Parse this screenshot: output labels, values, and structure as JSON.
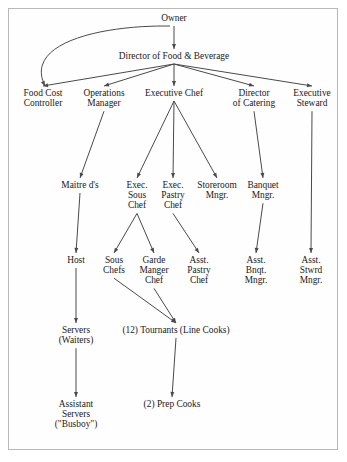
{
  "figure": {
    "kind": "organization-chart",
    "title_visible": false,
    "border_color": "#b9b9b5",
    "background_color": "#ffffff",
    "text_color": "#1a1a1a",
    "edge_color": "#4a4a4a"
  },
  "chart_data": {
    "type": "diagram",
    "subtype": "hierarchical-org-chart",
    "title": "",
    "orientation": "top-down",
    "nodes": [
      {
        "id": "owner",
        "label": "Owner",
        "lines": [
          "Owner"
        ],
        "level": 1,
        "x": 174,
        "y": 21
      },
      {
        "id": "dir_fb",
        "label": "Director of Food & Beverage",
        "lines": [
          "Director of Food & Beverage"
        ],
        "level": 2,
        "x": 174,
        "y": 59
      },
      {
        "id": "food_cost",
        "label": "Food Cost Controller",
        "lines": [
          "Food Cost",
          "Controller"
        ],
        "level": 3,
        "x": 43,
        "y": 96
      },
      {
        "id": "ops_mgr",
        "label": "Operations Manager",
        "lines": [
          "Operations",
          "Manager"
        ],
        "level": 3,
        "x": 104,
        "y": 96
      },
      {
        "id": "exec_chef",
        "label": "Executive Chef",
        "lines": [
          "Executive Chef"
        ],
        "level": 3,
        "x": 174,
        "y": 96
      },
      {
        "id": "dir_catering",
        "label": "Director of Catering",
        "lines": [
          "Director",
          "of Catering"
        ],
        "level": 3,
        "x": 254,
        "y": 96
      },
      {
        "id": "exec_steward",
        "label": "Executive Steward",
        "lines": [
          "Executive",
          "Steward"
        ],
        "level": 3,
        "x": 312,
        "y": 96
      },
      {
        "id": "maitre_d",
        "label": "Maitre d's",
        "lines": [
          "Maitre d's"
        ],
        "level": 4,
        "x": 80,
        "y": 188
      },
      {
        "id": "exec_sous",
        "label": "Exec. Sous Chef",
        "lines": [
          "Exec.",
          "Sous",
          "Chef"
        ],
        "level": 4,
        "x": 137,
        "y": 188
      },
      {
        "id": "exec_pastry",
        "label": "Exec. Pastry Chef",
        "lines": [
          "Exec.",
          "Pastry",
          "Chef"
        ],
        "level": 4,
        "x": 173,
        "y": 188
      },
      {
        "id": "storeroom",
        "label": "Storeroom Mngr.",
        "lines": [
          "Storeroom",
          "Mngr."
        ],
        "level": 4,
        "x": 217,
        "y": 188
      },
      {
        "id": "banquet",
        "label": "Banquet Mngr.",
        "lines": [
          "Banquet",
          "Mngr."
        ],
        "level": 4,
        "x": 263,
        "y": 188
      },
      {
        "id": "host",
        "label": "Host",
        "lines": [
          "Host"
        ],
        "level": 5,
        "x": 76,
        "y": 263
      },
      {
        "id": "sous_chefs",
        "label": "Sous Chefs",
        "lines": [
          "Sous",
          "Chefs"
        ],
        "level": 5,
        "x": 114,
        "y": 263
      },
      {
        "id": "garde_manger",
        "label": "Garde Manger Chef",
        "lines": [
          "Garde",
          "Manger",
          "Chef"
        ],
        "level": 5,
        "x": 154,
        "y": 263
      },
      {
        "id": "asst_pastry",
        "label": "Asst. Pastry Chef",
        "lines": [
          "Asst.",
          "Pastry",
          "Chef"
        ],
        "level": 5,
        "x": 199,
        "y": 263
      },
      {
        "id": "asst_bnqt",
        "label": "Asst. Bnqt. Mngr.",
        "lines": [
          "Asst.",
          "Bnqt.",
          "Mngr."
        ],
        "level": 5,
        "x": 256,
        "y": 263
      },
      {
        "id": "asst_stwrd",
        "label": "Asst. Stwrd Mngr.",
        "lines": [
          "Asst.",
          "Stwrd",
          "Mngr."
        ],
        "level": 5,
        "x": 311,
        "y": 263
      },
      {
        "id": "servers",
        "label": "Servers (Waiters)",
        "lines": [
          "Servers",
          "(Waiters)"
        ],
        "level": 6,
        "x": 76,
        "y": 333
      },
      {
        "id": "tournants",
        "label": "(12) Tournants (Line Cooks)",
        "lines": [
          "(12) Tournants (Line Cooks)"
        ],
        "level": 6,
        "x": 176,
        "y": 333
      },
      {
        "id": "asst_servers",
        "label": "Assistant Servers (\"Busboy\")",
        "lines": [
          "Assistant",
          "Servers",
          "(\"Busboy\")"
        ],
        "level": 7,
        "x": 76,
        "y": 407
      },
      {
        "id": "prep_cooks",
        "label": "(2) Prep Cooks",
        "lines": [
          "(2) Prep Cooks"
        ],
        "level": 7,
        "x": 172,
        "y": 407
      }
    ],
    "edges": [
      {
        "from": "owner",
        "to": "dir_fb",
        "style": "straight-arrow"
      },
      {
        "from": "owner",
        "to": "food_cost",
        "style": "curved-arrow"
      },
      {
        "from": "dir_fb",
        "to": "food_cost",
        "style": "straight-arrow"
      },
      {
        "from": "dir_fb",
        "to": "ops_mgr",
        "style": "straight-arrow"
      },
      {
        "from": "dir_fb",
        "to": "exec_chef",
        "style": "straight-arrow"
      },
      {
        "from": "dir_fb",
        "to": "dir_catering",
        "style": "straight-arrow"
      },
      {
        "from": "dir_fb",
        "to": "exec_steward",
        "style": "straight-arrow"
      },
      {
        "from": "ops_mgr",
        "to": "maitre_d",
        "style": "straight-arrow"
      },
      {
        "from": "exec_chef",
        "to": "exec_sous",
        "style": "straight-arrow"
      },
      {
        "from": "exec_chef",
        "to": "exec_pastry",
        "style": "straight-arrow"
      },
      {
        "from": "exec_chef",
        "to": "storeroom",
        "style": "straight-arrow"
      },
      {
        "from": "dir_catering",
        "to": "banquet",
        "style": "straight-arrow"
      },
      {
        "from": "maitre_d",
        "to": "host",
        "style": "straight-arrow"
      },
      {
        "from": "exec_sous",
        "to": "sous_chefs",
        "style": "straight-arrow"
      },
      {
        "from": "exec_sous",
        "to": "garde_manger",
        "style": "straight-arrow"
      },
      {
        "from": "exec_pastry",
        "to": "asst_pastry",
        "style": "straight-arrow"
      },
      {
        "from": "banquet",
        "to": "asst_bnqt",
        "style": "straight-arrow"
      },
      {
        "from": "exec_steward",
        "to": "asst_stwrd",
        "style": "straight-arrow"
      },
      {
        "from": "host",
        "to": "servers",
        "style": "straight-arrow"
      },
      {
        "from": "sous_chefs",
        "to": "tournants",
        "style": "straight-arrow"
      },
      {
        "from": "garde_manger",
        "to": "tournants",
        "style": "straight-arrow"
      },
      {
        "from": "servers",
        "to": "asst_servers",
        "style": "straight-arrow"
      },
      {
        "from": "tournants",
        "to": "prep_cooks",
        "style": "straight-arrow"
      }
    ]
  }
}
